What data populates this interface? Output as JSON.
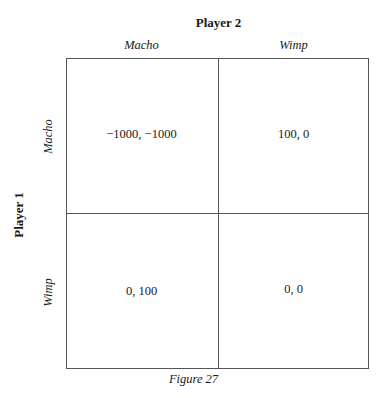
{
  "figure": {
    "caption": "Figure 27",
    "player_column": "Player 2",
    "player_row": "Player 1",
    "columns": [
      "Macho",
      "Wimp"
    ],
    "rows": [
      "Macho",
      "Wimp"
    ],
    "payoffs": [
      [
        "−1000, −1000",
        "100, 0"
      ],
      [
        "0, 100",
        "0, 0"
      ]
    ]
  }
}
